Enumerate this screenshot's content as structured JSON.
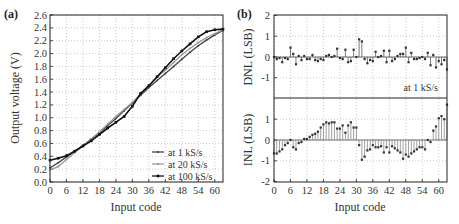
{
  "chart_data": [
    {
      "panel": "(a)",
      "type": "line",
      "title": "",
      "xlabel": "Input code",
      "ylabel": "Output voltage (V)",
      "xlim": [
        0,
        63
      ],
      "ylim": [
        0.0,
        2.6
      ],
      "xticks": [
        0,
        6,
        12,
        18,
        24,
        30,
        36,
        42,
        48,
        54,
        60
      ],
      "yticks": [
        "0.0",
        "0.2",
        "0.4",
        "0.6",
        "0.8",
        "1.0",
        "1.2",
        "1.4",
        "1.6",
        "1.8",
        "2.0",
        "2.2",
        "2.4",
        "2.6"
      ],
      "grid": true,
      "legend_position": "lower right",
      "x": [
        0,
        3,
        6,
        9,
        12,
        15,
        18,
        21,
        24,
        27,
        30,
        33,
        36,
        39,
        42,
        45,
        48,
        51,
        54,
        57,
        60,
        63
      ],
      "series": [
        {
          "name": "at 1 kS/s",
          "color": "#444444",
          "marker": "small-dot",
          "values": [
            0.22,
            0.3,
            0.39,
            0.48,
            0.57,
            0.67,
            0.77,
            0.88,
            0.99,
            1.11,
            1.23,
            1.35,
            1.47,
            1.58,
            1.69,
            1.8,
            1.91,
            2.02,
            2.12,
            2.21,
            2.29,
            2.36
          ]
        },
        {
          "name": "at 20 kS/s",
          "color": "#999999",
          "marker": "small-dot",
          "values": [
            0.19,
            0.24,
            0.35,
            0.46,
            0.56,
            0.67,
            0.78,
            0.9,
            1.02,
            1.13,
            1.24,
            1.37,
            1.5,
            1.63,
            1.74,
            1.86,
            1.98,
            2.08,
            2.17,
            2.25,
            2.31,
            2.37
          ]
        },
        {
          "name": "at 100 kS/s",
          "color": "#111111",
          "marker": "square",
          "values": [
            0.34,
            0.37,
            0.41,
            0.48,
            0.56,
            0.64,
            0.74,
            0.84,
            0.93,
            1.02,
            1.18,
            1.38,
            1.5,
            1.64,
            1.78,
            1.92,
            2.04,
            2.15,
            2.26,
            2.34,
            2.37,
            2.38
          ]
        }
      ]
    },
    {
      "panel": "(b)",
      "type": "stem",
      "subplots": [
        {
          "name": "DNL",
          "ylabel": "DNL (LSB)",
          "ylim": [
            -2,
            2
          ],
          "yticks": [
            "2",
            "1",
            "0",
            "-1"
          ],
          "annotation": "at 1 kS/s",
          "x": [
            0,
            1,
            2,
            3,
            4,
            5,
            6,
            7,
            8,
            9,
            10,
            11,
            12,
            13,
            14,
            15,
            16,
            17,
            18,
            19,
            20,
            21,
            22,
            23,
            24,
            25,
            26,
            27,
            28,
            29,
            30,
            31,
            32,
            33,
            34,
            35,
            36,
            37,
            38,
            39,
            40,
            41,
            42,
            43,
            44,
            45,
            46,
            47,
            48,
            49,
            50,
            51,
            52,
            53,
            54,
            55,
            56,
            57,
            58,
            59,
            60,
            61,
            62,
            63
          ],
          "values": [
            0.0,
            -0.1,
            -0.05,
            -0.25,
            -0.05,
            -0.1,
            0.45,
            0.15,
            -0.35,
            0.05,
            -0.15,
            0.05,
            -0.1,
            -0.1,
            0.1,
            -0.15,
            -0.2,
            -0.1,
            -0.15,
            0.05,
            0.1,
            0.0,
            0.05,
            0.4,
            -0.05,
            -0.1,
            0.35,
            -0.25,
            -0.2,
            0.35,
            0.0,
            0.85,
            0.75,
            -0.1,
            -0.3,
            -0.15,
            -0.2,
            0.25,
            0.0,
            0.05,
            0.3,
            -0.25,
            0.3,
            -0.2,
            -0.1,
            0.05,
            0.15,
            0.15,
            0.45,
            -0.25,
            0.2,
            -0.1,
            -0.1,
            -0.05,
            0.0,
            -0.1,
            0.2,
            -0.4,
            0.1,
            -0.5,
            -0.2,
            -0.35,
            -0.15,
            -0.6
          ]
        },
        {
          "name": "INL",
          "ylabel": "INL (LSB)",
          "ylim": [
            -2,
            2
          ],
          "yticks": [
            "1",
            "0",
            "-1",
            "-2"
          ],
          "x": [
            0,
            1,
            2,
            3,
            4,
            5,
            6,
            7,
            8,
            9,
            10,
            11,
            12,
            13,
            14,
            15,
            16,
            17,
            18,
            19,
            20,
            21,
            22,
            23,
            24,
            25,
            26,
            27,
            28,
            29,
            30,
            31,
            32,
            33,
            34,
            35,
            36,
            37,
            38,
            39,
            40,
            41,
            42,
            43,
            44,
            45,
            46,
            47,
            48,
            49,
            50,
            51,
            52,
            53,
            54,
            55,
            56,
            57,
            58,
            59,
            60,
            61,
            62,
            63
          ],
          "values": [
            -0.65,
            -0.65,
            -0.55,
            -0.45,
            -0.25,
            -0.15,
            0.0,
            -0.35,
            -0.45,
            -0.15,
            -0.1,
            0.05,
            0.05,
            0.15,
            0.25,
            0.3,
            0.4,
            0.6,
            0.75,
            0.85,
            0.8,
            0.85,
            0.85,
            0.55,
            0.55,
            0.7,
            0.35,
            0.7,
            0.85,
            0.6,
            0.6,
            -0.25,
            -0.95,
            -0.8,
            -0.5,
            -0.45,
            -0.25,
            -0.35,
            -0.35,
            -0.3,
            -0.6,
            -0.35,
            -0.6,
            -0.3,
            -0.4,
            -0.5,
            -0.6,
            -0.9,
            -0.7,
            -0.8,
            -0.65,
            -0.55,
            -0.45,
            -0.35,
            -0.35,
            -0.45,
            0.0,
            -0.1,
            0.45,
            0.65,
            1.05,
            1.15,
            1.0,
            1.7
          ]
        }
      ],
      "xlabel": "Input code",
      "xlim": [
        0,
        63
      ],
      "xticks": [
        0,
        6,
        12,
        18,
        24,
        30,
        36,
        42,
        48,
        54,
        60
      ],
      "grid": true
    }
  ]
}
